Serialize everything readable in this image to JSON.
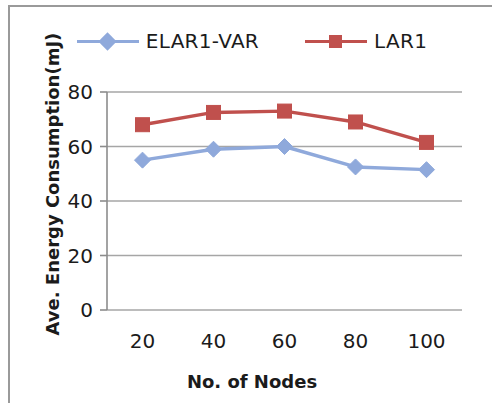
{
  "chart_data": {
    "type": "line",
    "title": "",
    "xlabel": "No. of Nodes",
    "ylabel": "Ave. Energy Consumption(mJ)",
    "categories": [
      20,
      40,
      60,
      80,
      100
    ],
    "x_tick_labels": [
      "20",
      "40",
      "60",
      "80",
      "100"
    ],
    "y_tick_labels": [
      "0",
      "20",
      "40",
      "60",
      "80"
    ],
    "y_ticks": [
      0,
      20,
      40,
      60,
      80
    ],
    "ylim": [
      0,
      80
    ],
    "grid": "horizontal",
    "legend_position": "top-center",
    "series": [
      {
        "name": "ELAR1-VAR",
        "values": [
          55,
          59,
          60,
          52.5,
          51.5
        ],
        "color": "#8FA9DB",
        "marker": "diamond"
      },
      {
        "name": "LAR1",
        "values": [
          68,
          72.5,
          73,
          69,
          61.5
        ],
        "color": "#C0504D",
        "marker": "square"
      }
    ]
  },
  "legend": {
    "items": [
      {
        "label": "ELAR1-VAR",
        "color": "#8FA9DB",
        "marker": "diamond"
      },
      {
        "label": "LAR1",
        "color": "#C0504D",
        "marker": "square"
      }
    ]
  },
  "axes": {
    "x_title": "No. of Nodes",
    "y_title": "Ave. Energy Consumption(mJ)"
  },
  "colors": {
    "series_1": "#8FA9DB",
    "series_2": "#C0504D",
    "gridline": "#a6a6a6",
    "axis": "#8c8c8c",
    "frame": "#9a9a9a",
    "text": "#1b1b1b",
    "background": "#ffffff"
  }
}
